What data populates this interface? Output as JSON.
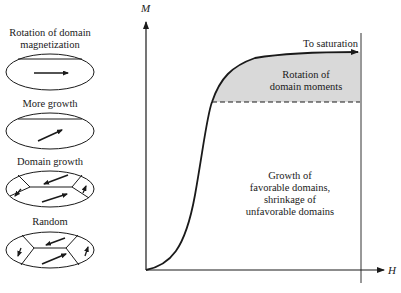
{
  "axes": {
    "y_label": "M",
    "x_label": "H"
  },
  "annotations": {
    "saturation": "To saturation",
    "rotation_region": [
      "Rotation of",
      "domain moments"
    ],
    "growth_region": [
      "Growth of",
      "favorable domains,",
      "shrinkage of",
      "unfavorable domains"
    ]
  },
  "stages": [
    {
      "label": [
        "Rotation of domain",
        "magnetization"
      ]
    },
    {
      "label": [
        "More growth"
      ]
    },
    {
      "label": [
        "Domain growth"
      ]
    },
    {
      "label": [
        "Random"
      ]
    }
  ],
  "colors": {
    "line": "#1a1a1a",
    "shaded_region": "#d9d9d9"
  }
}
